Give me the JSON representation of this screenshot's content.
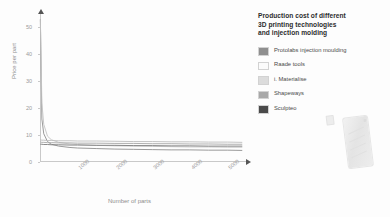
{
  "legend": {
    "title": "Production cost of different 3D printing technologies and injection molding",
    "title_lines": [
      "Production cost of different",
      "3D printing technologies",
      "and injection molding"
    ],
    "items": [
      {
        "label": "Protolabs injection moulding",
        "color": "#8f8f8f"
      },
      {
        "label": "Raade tools",
        "color": "#fbfbfb"
      },
      {
        "label": "i. Materialise",
        "color": "#dcdcdc"
      },
      {
        "label": "Shapeways",
        "color": "#a8a8a8"
      },
      {
        "label": "Sculpteo",
        "color": "#4a4a4a"
      }
    ]
  },
  "product": {
    "name": "3d-printed-phone-case"
  },
  "chart_data": {
    "type": "line",
    "title": "Production cost of different 3D printing technologies and injection molding",
    "xlabel": "Number of parts",
    "ylabel": "Price per part",
    "xlim": [
      0,
      5500
    ],
    "ylim": [
      0,
      55
    ],
    "xticks": [
      1000,
      2000,
      3000,
      4000,
      5000
    ],
    "yticks": [
      0,
      10,
      20,
      30,
      40,
      50
    ],
    "grid": false,
    "legend_position": "right",
    "x": [
      10,
      50,
      100,
      200,
      300,
      500,
      800,
      1000,
      1500,
      2000,
      2500,
      3000,
      3500,
      4000,
      4500,
      5000,
      5400
    ],
    "series": [
      {
        "name": "Protolabs injection moulding",
        "color": "#8f8f8f",
        "values": [
          53.0,
          16.0,
          10.5,
          7.6,
          6.6,
          5.9,
          5.4,
          5.2,
          5.0,
          4.8,
          4.7,
          4.6,
          4.5,
          4.5,
          4.4,
          4.4,
          4.3
        ]
      },
      {
        "name": "Raade tools",
        "color": "#c4c4c4",
        "values": [
          53.0,
          22.0,
          14.0,
          9.6,
          8.3,
          7.3,
          6.7,
          6.5,
          6.2,
          6.0,
          5.9,
          5.8,
          5.7,
          5.6,
          5.6,
          5.5,
          5.5
        ]
      },
      {
        "name": "i. Materialise",
        "color": "#bdbdbd",
        "values": [
          8.2,
          8.1,
          8.1,
          8.0,
          8.0,
          7.9,
          7.9,
          7.8,
          7.8,
          7.7,
          7.6,
          7.6,
          7.5,
          7.5,
          7.4,
          7.4,
          7.3
        ]
      },
      {
        "name": "Shapeways",
        "color": "#a8a8a8",
        "values": [
          7.4,
          7.3,
          7.3,
          7.2,
          7.2,
          7.1,
          7.1,
          7.0,
          7.0,
          6.9,
          6.9,
          6.8,
          6.8,
          6.7,
          6.7,
          6.6,
          6.6
        ]
      },
      {
        "name": "Sculpteo",
        "color": "#7d7d7d",
        "values": [
          6.6,
          6.6,
          6.5,
          6.5,
          6.4,
          6.4,
          6.3,
          6.3,
          6.2,
          6.2,
          6.1,
          6.1,
          6.0,
          6.0,
          5.9,
          5.9,
          5.9
        ]
      }
    ]
  }
}
